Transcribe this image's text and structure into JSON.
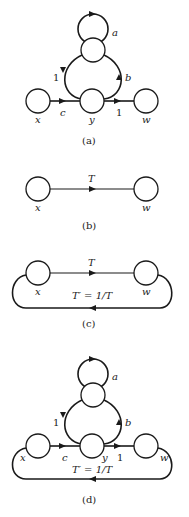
{
  "panels": [
    {
      "id": "a",
      "caption": "(a)",
      "nodes": {
        "x": "x",
        "y": "y",
        "w": "w"
      },
      "edges": {
        "self_loop": "a",
        "feedback_down": "1",
        "feedback_up": "b",
        "x_to_y": "c",
        "y_to_w": "1"
      }
    },
    {
      "id": "b",
      "caption": "(b)",
      "nodes": {
        "x": "x",
        "w": "w"
      },
      "edges": {
        "x_to_w": "T"
      }
    },
    {
      "id": "c",
      "caption": "(c)",
      "nodes": {
        "x": "x",
        "w": "w"
      },
      "edges": {
        "x_to_w": "T",
        "w_to_x": "T′ = 1/T"
      }
    },
    {
      "id": "d",
      "caption": "(d)",
      "nodes": {
        "x": "x",
        "y": "y",
        "w": "w"
      },
      "edges": {
        "self_loop": "a",
        "feedback_down": "1",
        "feedback_up": "b",
        "x_to_y": "c",
        "y_to_w": "1",
        "w_to_x": "T′ = 1/T"
      }
    }
  ]
}
